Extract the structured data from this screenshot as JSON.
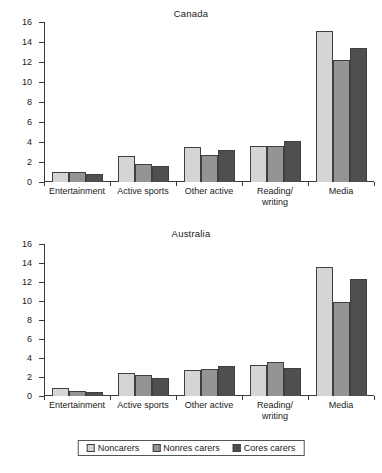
{
  "chart_data": [
    {
      "type": "bar",
      "title": "Canada",
      "xlabel": "",
      "ylabel": "",
      "ylim": [
        0,
        16
      ],
      "yticks": [
        0,
        2,
        4,
        6,
        8,
        10,
        12,
        14,
        16
      ],
      "grid": false,
      "legend_position": "bottom",
      "categories": [
        "Entertainment",
        "Active sports",
        "Other active",
        "Reading/ writing",
        "Media"
      ],
      "series": [
        {
          "name": "Noncarers",
          "color": "#d5d5d5",
          "values": [
            1.0,
            2.6,
            3.5,
            3.6,
            15.1
          ]
        },
        {
          "name": "Nonres carers",
          "color": "#949494",
          "values": [
            1.0,
            1.8,
            2.75,
            3.65,
            12.2
          ]
        },
        {
          "name": "Cores carers",
          "color": "#4f4f4f",
          "values": [
            0.85,
            1.6,
            3.2,
            4.1,
            13.4
          ]
        }
      ]
    },
    {
      "type": "bar",
      "title": "Australia",
      "xlabel": "",
      "ylabel": "",
      "ylim": [
        0,
        16
      ],
      "yticks": [
        0,
        2,
        4,
        6,
        8,
        10,
        12,
        14,
        16
      ],
      "grid": false,
      "legend_position": "bottom",
      "categories": [
        "Entertainment",
        "Active sports",
        "Other active",
        "Reading/ writing",
        "Media"
      ],
      "series": [
        {
          "name": "Noncarers",
          "color": "#d5d5d5",
          "values": [
            0.85,
            2.4,
            2.7,
            3.3,
            13.6
          ]
        },
        {
          "name": "Nonres carers",
          "color": "#949494",
          "values": [
            0.55,
            2.2,
            2.8,
            3.6,
            9.9
          ]
        },
        {
          "name": "Cores carers",
          "color": "#4f4f4f",
          "values": [
            0.4,
            1.9,
            3.2,
            2.9,
            12.3
          ]
        }
      ]
    }
  ],
  "panels": {
    "canada": {
      "title": "Canada",
      "yticks": [
        "16",
        "14",
        "12",
        "10",
        "8",
        "6",
        "4",
        "2",
        "0"
      ],
      "xlabels": [
        {
          "line1": "Entertainment",
          "line2": ""
        },
        {
          "line1": "Active sports",
          "line2": ""
        },
        {
          "line1": "Other active",
          "line2": ""
        },
        {
          "line1": "Reading/",
          "line2": "writing"
        },
        {
          "line1": "Media",
          "line2": ""
        }
      ]
    },
    "australia": {
      "title": "Australia",
      "yticks": [
        "16",
        "14",
        "12",
        "10",
        "8",
        "6",
        "4",
        "2",
        "0"
      ],
      "xlabels": [
        {
          "line1": "Entertainment",
          "line2": ""
        },
        {
          "line1": "Active sports",
          "line2": ""
        },
        {
          "line1": "Other active",
          "line2": ""
        },
        {
          "line1": "Reading/",
          "line2": "writing"
        },
        {
          "line1": "Media",
          "line2": ""
        }
      ]
    }
  },
  "legend": {
    "items": [
      {
        "label": "Noncarers",
        "color": "#d5d5d5"
      },
      {
        "label": "Nonres carers",
        "color": "#949494"
      },
      {
        "label": "Cores carers",
        "color": "#4f4f4f"
      }
    ]
  }
}
